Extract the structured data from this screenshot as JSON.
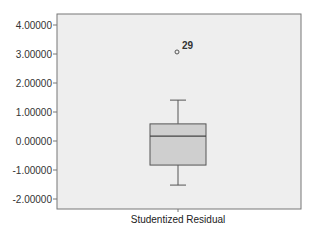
{
  "chart_data": {
    "type": "box",
    "title": "",
    "xlabel": "Studentized Residual",
    "ylabel": "",
    "ylim": [
      -2.34,
      4.38
    ],
    "yticks": [
      4.0,
      3.0,
      2.0,
      1.0,
      0.0,
      -1.0,
      -2.0
    ],
    "ytick_labels": [
      "4.00000",
      "3.00000",
      "2.00000",
      "1.00000",
      "0.00000",
      "-1.00000",
      "-2.00000"
    ],
    "grid": false,
    "legend": null,
    "categories": [
      "Studentized Residual"
    ],
    "boxes": [
      {
        "name": "Studentized Residual",
        "whisker_high": 1.41,
        "q3": 0.59,
        "median": 0.17,
        "q1": -0.83,
        "whisker_low": -1.52,
        "outliers": [
          {
            "value": 3.07,
            "label": "29"
          }
        ]
      }
    ]
  },
  "colors": {
    "plot_background": "#eeeeee",
    "box_fill": "#cfcfcf",
    "line": "#555555",
    "frame": "#777777"
  },
  "layout": {
    "frame": {
      "left": 57,
      "top": 14,
      "right": 301,
      "bottom": 209
    },
    "zero_y": 141,
    "px_per_unit": 29,
    "box_center_x": 178,
    "box_half_width": 28,
    "cap_half_width": 8
  }
}
